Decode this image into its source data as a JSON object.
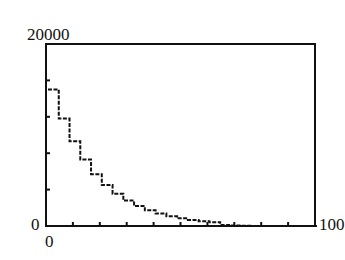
{
  "chart_data": {
    "type": "line",
    "title": "",
    "xlabel": "",
    "ylabel": "",
    "xlim": [
      0,
      100
    ],
    "ylim": [
      0,
      20000
    ],
    "x_tick_step": 10,
    "y_tick_step": 4000,
    "grid": false,
    "legend": null,
    "axis_labels": {
      "y_max": "20000",
      "y_min": "0",
      "x_min": "0",
      "x_max": "100"
    },
    "series": [
      {
        "name": "decay",
        "style": "step",
        "x": [
          0,
          4,
          8,
          12,
          16,
          20,
          24,
          28,
          32,
          36,
          40,
          44,
          48,
          52,
          56,
          60,
          64,
          68,
          72,
          76,
          80,
          84,
          88,
          92,
          96,
          100
        ],
        "y": [
          15000,
          11800,
          9300,
          7300,
          5700,
          4500,
          3550,
          2800,
          2200,
          1730,
          1360,
          1070,
          840,
          660,
          520,
          410,
          120,
          50,
          20,
          0,
          0,
          0,
          0,
          0,
          0,
          0
        ]
      }
    ],
    "colors": {
      "axis": "#111111",
      "line": "#111111",
      "background": "#ffffff"
    }
  }
}
